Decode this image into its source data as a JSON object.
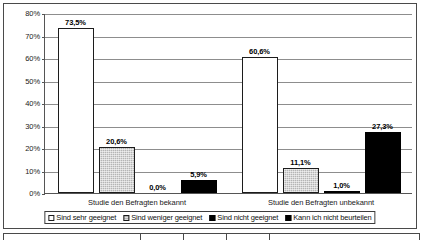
{
  "chart_data": {
    "type": "bar",
    "title": "",
    "subtitle": "",
    "xlabel": "",
    "ylabel": "",
    "categories": [
      "Studie den Befragten bekannt",
      "Studie den Befragten unbekannt"
    ],
    "series": [
      {
        "name": "Sind sehr geeignet",
        "color": "#ffffff",
        "values": [
          73.5,
          60.6
        ]
      },
      {
        "name": "Sind weniger geeignet",
        "color": "#b5b5b5",
        "values": [
          20.6,
          11.1
        ]
      },
      {
        "name": "Sind nicht geeignet",
        "color": "#000000",
        "values": [
          0.0,
          1.0
        ]
      },
      {
        "name": "Kann ich nicht beurteilen",
        "color": "#000000",
        "values": [
          5.9,
          27.3
        ]
      }
    ],
    "data_labels": [
      [
        "73,5%",
        "20,6%",
        "0,0%",
        "5,9%"
      ],
      [
        "60,6%",
        "11,1%",
        "1,0%",
        "27,3%"
      ]
    ],
    "ylim": [
      0,
      80
    ],
    "ytick_values": [
      0,
      10,
      20,
      30,
      40,
      50,
      60,
      70,
      80
    ],
    "ytick_labels": [
      "0%",
      "10%",
      "20%",
      "30%",
      "40%",
      "50%",
      "60%",
      "70%",
      "80%"
    ],
    "grid": true,
    "grid_axis": "y",
    "legend_position": "bottom",
    "legend_entries": [
      "Sind sehr geeignet",
      "Sind weniger geeignet",
      "Sind nicht geeignet",
      "Kann ich nicht beurteilen"
    ]
  },
  "bottom_table": {
    "column_separators_x": [
      136,
      179,
      222,
      265
    ]
  }
}
